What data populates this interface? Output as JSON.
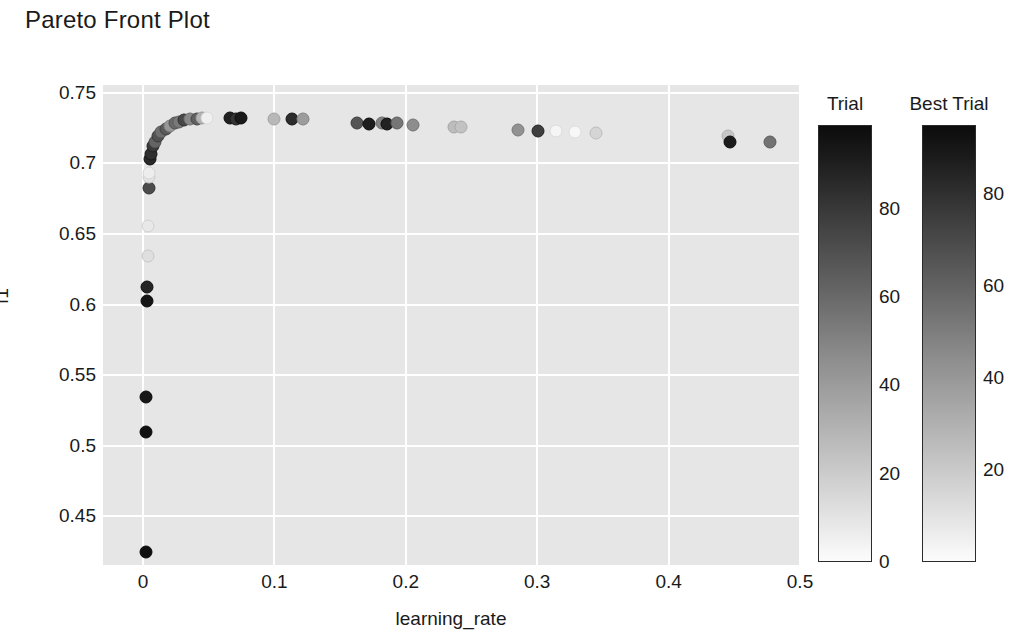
{
  "chart_data": {
    "type": "scatter",
    "title": "Pareto Front Plot",
    "xlabel": "learning_rate",
    "ylabel": "f1",
    "xlim": [
      -0.0305,
      0.5
    ],
    "ylim": [
      0.4155,
      0.7556
    ],
    "xticks": [
      "0",
      "0.1",
      "0.2",
      "0.3",
      "0.4",
      "0.5"
    ],
    "xtick_values": [
      0,
      0.1,
      0.2,
      0.3,
      0.4,
      0.5
    ],
    "yticks": [
      "0.75",
      "0.7",
      "0.65",
      "0.6",
      "0.55",
      "0.5",
      "0.45"
    ],
    "ytick_values": [
      0.75,
      0.7,
      0.65,
      0.6,
      0.55,
      0.5,
      0.45
    ],
    "grid": true,
    "grid_color": "#ffffff",
    "plot_background": "#e6e6e6",
    "colormap": "grayscale-dark-high",
    "legend_position": "right",
    "series": [
      {
        "name": "Trial",
        "colorbar": {
          "label": "Trial",
          "ticks": [
            "0",
            "20",
            "40",
            "60",
            "80"
          ],
          "tick_values": [
            0,
            20,
            40,
            60,
            80
          ],
          "range": [
            0,
            99
          ]
        },
        "points": [
          {
            "x": 0.0022,
            "y": 0.4245,
            "c": 97
          },
          {
            "x": 0.002,
            "y": 0.5095,
            "c": 96
          },
          {
            "x": 0.0024,
            "y": 0.5345,
            "c": 94
          },
          {
            "x": 0.003,
            "y": 0.6025,
            "c": 95
          },
          {
            "x": 0.0032,
            "y": 0.6125,
            "c": 88
          },
          {
            "x": 0.0035,
            "y": 0.6345,
            "c": 12
          },
          {
            "x": 0.0038,
            "y": 0.6555,
            "c": 8
          },
          {
            "x": 0.0042,
            "y": 0.6825,
            "c": 72
          },
          {
            "x": 0.0045,
            "y": 0.6905,
            "c": 10
          },
          {
            "x": 0.0048,
            "y": 0.6935,
            "c": 6
          },
          {
            "x": 0.0052,
            "y": 0.7035,
            "c": 86
          },
          {
            "x": 0.0058,
            "y": 0.7065,
            "c": 84
          },
          {
            "x": 0.0072,
            "y": 0.7125,
            "c": 80
          },
          {
            "x": 0.009,
            "y": 0.7155,
            "c": 62
          },
          {
            "x": 0.0115,
            "y": 0.7195,
            "c": 70
          },
          {
            "x": 0.014,
            "y": 0.7225,
            "c": 58
          },
          {
            "x": 0.0175,
            "y": 0.7245,
            "c": 66
          },
          {
            "x": 0.0205,
            "y": 0.7265,
            "c": 42
          },
          {
            "x": 0.024,
            "y": 0.7285,
            "c": 60
          },
          {
            "x": 0.0275,
            "y": 0.7295,
            "c": 54
          },
          {
            "x": 0.0315,
            "y": 0.7305,
            "c": 74
          },
          {
            "x": 0.036,
            "y": 0.7312,
            "c": 48
          },
          {
            "x": 0.041,
            "y": 0.7318,
            "c": 64
          },
          {
            "x": 0.045,
            "y": 0.7322,
            "c": 30
          },
          {
            "x": 0.049,
            "y": 0.7325,
            "c": 5
          },
          {
            "x": 0.0665,
            "y": 0.732,
            "c": 90
          },
          {
            "x": 0.0705,
            "y": 0.7318,
            "c": 82
          },
          {
            "x": 0.0745,
            "y": 0.7322,
            "c": 93
          },
          {
            "x": 0.0995,
            "y": 0.7315,
            "c": 28
          },
          {
            "x": 0.113,
            "y": 0.7318,
            "c": 85
          },
          {
            "x": 0.1215,
            "y": 0.7312,
            "c": 40
          },
          {
            "x": 0.163,
            "y": 0.7288,
            "c": 68
          },
          {
            "x": 0.172,
            "y": 0.728,
            "c": 91
          },
          {
            "x": 0.1815,
            "y": 0.7288,
            "c": 50
          },
          {
            "x": 0.186,
            "y": 0.7282,
            "c": 89
          },
          {
            "x": 0.1935,
            "y": 0.7285,
            "c": 55
          },
          {
            "x": 0.2055,
            "y": 0.7275,
            "c": 46
          },
          {
            "x": 0.237,
            "y": 0.7258,
            "c": 26
          },
          {
            "x": 0.242,
            "y": 0.7255,
            "c": 24
          },
          {
            "x": 0.2855,
            "y": 0.7238,
            "c": 44
          },
          {
            "x": 0.3005,
            "y": 0.7232,
            "c": 78
          },
          {
            "x": 0.3145,
            "y": 0.7228,
            "c": 3
          },
          {
            "x": 0.3285,
            "y": 0.7226,
            "c": 2
          },
          {
            "x": 0.345,
            "y": 0.7218,
            "c": 16
          },
          {
            "x": 0.445,
            "y": 0.7195,
            "c": 22
          },
          {
            "x": 0.4465,
            "y": 0.715,
            "c": 92
          },
          {
            "x": 0.477,
            "y": 0.7155,
            "c": 56
          }
        ]
      }
    ],
    "best_trial_colorbar": {
      "label": "Best Trial",
      "ticks": [
        "20",
        "40",
        "60",
        "80"
      ],
      "tick_values": [
        20,
        40,
        60,
        80
      ],
      "range": [
        0,
        95
      ]
    }
  },
  "title": "Pareto Front Plot",
  "colorbars": [
    {
      "name": "trial",
      "label": "Trial",
      "ticks": [
        {
          "label": "80",
          "value": 80
        },
        {
          "label": "60",
          "value": 60
        },
        {
          "label": "40",
          "value": 40
        },
        {
          "label": "20",
          "value": 20
        },
        {
          "label": "0",
          "value": 0
        }
      ]
    },
    {
      "name": "best-trial",
      "label": "Best Trial",
      "ticks": [
        {
          "label": "80",
          "value": 80
        },
        {
          "label": "60",
          "value": 60
        },
        {
          "label": "40",
          "value": 40
        },
        {
          "label": "20",
          "value": 20
        }
      ]
    }
  ]
}
